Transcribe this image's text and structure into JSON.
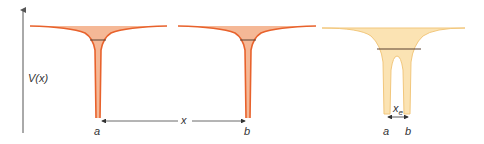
{
  "figure": {
    "y_axis_label": "V(x)",
    "separation_label": "x",
    "equilibrium_label_base": "x",
    "equilibrium_label_sub": "e",
    "left_well": {
      "label": "a"
    },
    "middle_well": {
      "label": "b"
    },
    "combined_well": {
      "label_a": "a",
      "label_b": "b"
    }
  },
  "colors": {
    "single_well_fill": "#f5b896",
    "single_well_stroke": "#e8622c",
    "combined_well_fill": "#fbe3b3",
    "combined_well_stroke": "#f2c77c",
    "energy_level": "#5a4030",
    "axis": "#555555"
  }
}
